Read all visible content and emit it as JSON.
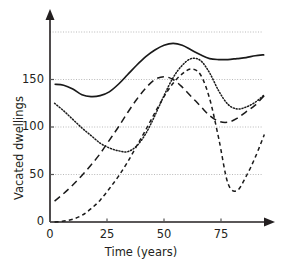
{
  "chart_data": {
    "type": "line",
    "title": "",
    "subtitle": "",
    "xlabel": "Time (years)",
    "ylabel": "Vacated dwellings",
    "xlim": [
      0,
      95
    ],
    "ylim": [
      0,
      205
    ],
    "xticks": [
      0,
      25,
      50,
      75
    ],
    "xtick_labels": [
      "0",
      "25",
      "50",
      "75"
    ],
    "yticks": [
      0,
      50,
      100,
      150
    ],
    "ytick_labels": [
      "0",
      "50",
      "100",
      "150"
    ],
    "gridlines_y": [
      50,
      100,
      150,
      200
    ],
    "grid": true,
    "grid_style": "dotted",
    "legend": null,
    "legend_position": "none",
    "annotations": [],
    "series": [
      {
        "name": "solid-curve",
        "style": "solid",
        "color": "#1a1a1a",
        "x": [
          2,
          6,
          10,
          14,
          18,
          22,
          26,
          30,
          34,
          38,
          42,
          46,
          50,
          54,
          58,
          62,
          66,
          70,
          74,
          78,
          82,
          86,
          90,
          94
        ],
        "values": [
          145,
          144,
          140,
          134,
          132,
          133,
          137,
          145,
          155,
          165,
          174,
          181,
          186,
          188,
          186,
          181,
          176,
          172,
          171,
          171,
          172,
          173,
          175,
          176
        ]
      },
      {
        "name": "dotted-curve",
        "style": "dotted",
        "color": "#1a1a1a",
        "x": [
          2,
          6,
          10,
          14,
          18,
          22,
          26,
          30,
          34,
          38,
          42,
          46,
          50,
          54,
          58,
          62,
          66,
          70,
          74,
          78,
          82,
          86,
          90,
          94
        ],
        "values": [
          125,
          117,
          108,
          99,
          91,
          83,
          78,
          75,
          74,
          80,
          93,
          112,
          133,
          152,
          165,
          172,
          170,
          157,
          138,
          124,
          119,
          121,
          126,
          134
        ]
      },
      {
        "name": "long-dash-curve",
        "style": "long-dash",
        "color": "#1a1a1a",
        "x": [
          2,
          6,
          10,
          14,
          18,
          22,
          26,
          30,
          34,
          38,
          42,
          46,
          50,
          54,
          58,
          62,
          66,
          70,
          74,
          78,
          82,
          86,
          90,
          94
        ],
        "values": [
          22,
          30,
          39,
          49,
          60,
          72,
          86,
          100,
          115,
          129,
          141,
          150,
          153,
          150,
          142,
          132,
          122,
          112,
          106,
          105,
          109,
          116,
          123,
          133
        ]
      },
      {
        "name": "short-dash-curve",
        "style": "short-dash",
        "color": "#1a1a1a",
        "x": [
          2,
          6,
          10,
          14,
          18,
          22,
          26,
          30,
          34,
          38,
          42,
          46,
          50,
          54,
          58,
          62,
          66,
          70,
          74,
          78,
          82,
          86,
          90,
          94
        ],
        "values": [
          0,
          1,
          3,
          7,
          14,
          23,
          35,
          48,
          63,
          80,
          97,
          115,
          132,
          146,
          156,
          161,
          155,
          130,
          88,
          41,
          33,
          48,
          68,
          92
        ]
      }
    ]
  },
  "figure": {
    "background": "#ffffff",
    "axis_color": "#231f20",
    "grid_color": "#b9b9b9",
    "line_color": "#1a1a1a"
  }
}
